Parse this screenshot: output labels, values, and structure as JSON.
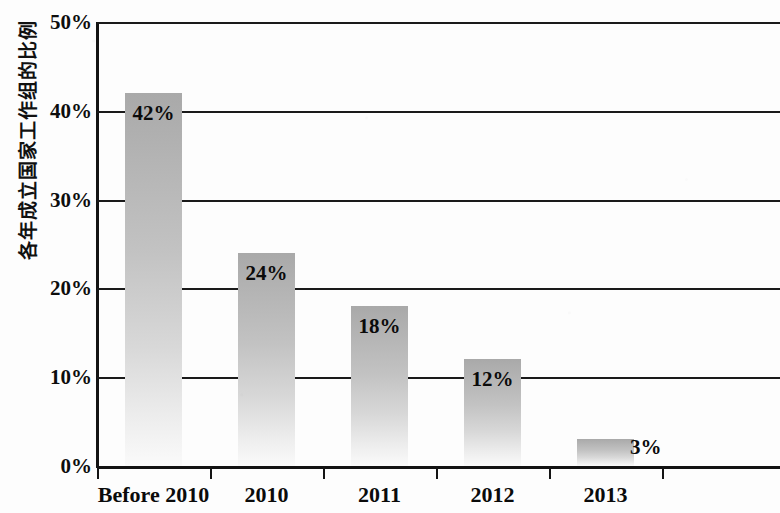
{
  "chart_data": {
    "type": "bar",
    "title": "",
    "subtitle": "",
    "xlabel": "",
    "ylabel": "各年成立国家工作组的比例",
    "categories": [
      "Before 2010",
      "2010",
      "2011",
      "2012",
      "2013"
    ],
    "values": [
      42,
      24,
      18,
      12,
      3
    ],
    "data_labels": [
      "42%",
      "24%",
      "18%",
      "12%",
      "3%"
    ],
    "ylim": [
      0,
      50
    ],
    "ytick_values": [
      0,
      10,
      20,
      30,
      40,
      50
    ],
    "ytick_labels": [
      "0%",
      "10%",
      "20%",
      "30%",
      "40%",
      "50%"
    ],
    "grid": true,
    "grid_axis": "y",
    "legend": false,
    "legend_position": "none",
    "units": "percent",
    "series": [
      {
        "name": "各年成立国家工作组的比例",
        "values": [
          42,
          24,
          18,
          12,
          3
        ]
      }
    ],
    "colors": {
      "bar_top": "#a9a9a9",
      "bar_bottom": "#fafafa",
      "gridline": "#1a1a1a",
      "axis": "#121212",
      "text": "#0b0b0b",
      "background": "#fdfdfd"
    }
  }
}
